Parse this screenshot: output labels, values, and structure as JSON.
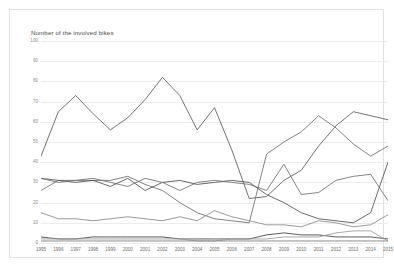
{
  "chart_data": {
    "type": "line",
    "title": "Number of the involved bikes",
    "xlabel": "",
    "ylabel": "Number of the involved bikes",
    "ylim": [
      0,
      100
    ],
    "ytick_step": 10,
    "grid": true,
    "legend": "none",
    "yticks": [
      "0",
      "10",
      "20",
      "30",
      "40",
      "50",
      "60",
      "70",
      "80",
      "90",
      "100"
    ],
    "categories": [
      "1995",
      "1996",
      "1997",
      "1998",
      "1999",
      "2000",
      "2001",
      "2002",
      "2003",
      "2004",
      "2005",
      "2006",
      "2007",
      "2008",
      "2009",
      "2010",
      "2011",
      "2012",
      "2013",
      "2014",
      "2015"
    ],
    "series": [
      {
        "name": "series-1",
        "color": "#5a5a5a",
        "values": [
          43,
          65,
          73,
          64,
          56,
          62,
          71,
          82,
          73,
          56,
          67,
          46,
          22,
          23,
          31,
          36,
          48,
          58,
          65,
          63,
          61
        ]
      },
      {
        "name": "series-2",
        "color": "#6b6b6b",
        "values": [
          26,
          31,
          31,
          31,
          31,
          33,
          29,
          26,
          20,
          15,
          12,
          11,
          10,
          44,
          50,
          55,
          63,
          57,
          49,
          43,
          48
        ]
      },
      {
        "name": "series-3",
        "color": "#4f4f4f",
        "values": [
          32,
          31,
          30,
          31,
          28,
          32,
          26,
          30,
          31,
          29,
          30,
          31,
          30,
          24,
          20,
          15,
          12,
          11,
          10,
          15,
          40
        ]
      },
      {
        "name": "series-4",
        "color": "#6f6f6f",
        "values": [
          32,
          30,
          31,
          32,
          30,
          28,
          32,
          30,
          26,
          30,
          31,
          30,
          29,
          26,
          39,
          24,
          25,
          31,
          33,
          34,
          21
        ]
      },
      {
        "name": "series-5",
        "color": "#888888",
        "values": [
          15,
          12,
          12,
          11,
          12,
          13,
          12,
          11,
          13,
          11,
          16,
          13,
          11,
          9,
          9,
          8,
          11,
          10,
          8,
          9,
          14
        ]
      },
      {
        "name": "series-6",
        "color": "#3f3f3f",
        "values": [
          3,
          2,
          2,
          3,
          3,
          3,
          3,
          3,
          2,
          2,
          2,
          2,
          2,
          4,
          5,
          4,
          4,
          3,
          3,
          3,
          2
        ]
      },
      {
        "name": "series-7",
        "color": "#9a9a9a",
        "values": [
          2,
          2,
          2,
          2,
          2,
          2,
          2,
          2,
          2,
          1,
          1,
          2,
          2,
          2,
          3,
          3,
          3,
          5,
          6,
          6,
          1
        ]
      },
      {
        "name": "series-8",
        "color": "#7a7a7a",
        "values": [
          1,
          1,
          1,
          1,
          1,
          1,
          1,
          1,
          1,
          1,
          1,
          1,
          1,
          1,
          1,
          1,
          1,
          1,
          1,
          1,
          1
        ]
      }
    ]
  }
}
